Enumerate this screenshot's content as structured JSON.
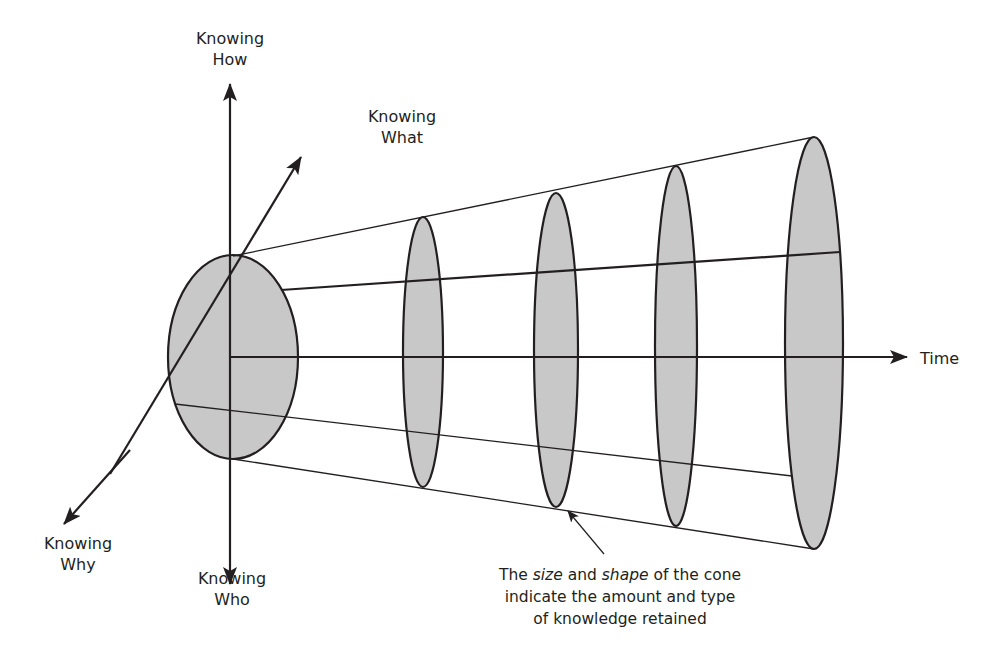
{
  "diagram": {
    "type": "knowledge-cone",
    "axes": {
      "up": {
        "line1": "Knowing",
        "line2": "How"
      },
      "down": {
        "line1": "Knowing",
        "line2": "Who"
      },
      "up_right": {
        "line1": "Knowing",
        "line2": "What"
      },
      "down_left": {
        "line1": "Knowing",
        "line2": "Why"
      },
      "right": {
        "label": "Time"
      }
    },
    "caption": {
      "part1": "The ",
      "italic1": "size",
      "part2": " and ",
      "italic2": "shape",
      "part3": " of the cone",
      "line2": "indicate the amount and type",
      "line3": "of knowledge retained"
    },
    "colors": {
      "stroke": "#231f20",
      "fill": "#c8c8c8",
      "background": "#ffffff"
    },
    "cross_sections": [
      {
        "id": "origin",
        "cx": 233,
        "cy": 357,
        "rx": 65,
        "ry": 102
      },
      {
        "id": "t1",
        "cx": 423,
        "cy": 352,
        "rx": 20,
        "ry": 135
      },
      {
        "id": "t2",
        "cx": 556,
        "cy": 350,
        "rx": 22,
        "ry": 157
      },
      {
        "id": "t3",
        "cx": 676,
        "cy": 346,
        "rx": 21,
        "ry": 180
      },
      {
        "id": "t4",
        "cx": 814,
        "cy": 343,
        "rx": 29,
        "ry": 206
      }
    ]
  }
}
